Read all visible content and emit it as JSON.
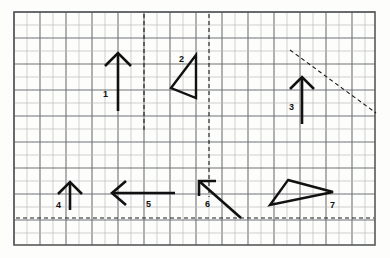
{
  "figure": {
    "name": "vector-diagram-on-graph-paper",
    "caption": "",
    "background_color": "#fdfdfb",
    "grid": {
      "name": "graph-paper-grid",
      "x0": 14,
      "y0": 12,
      "x1": 375,
      "y1": 245,
      "cell_size": 13,
      "minor_color": "#b9bcc0",
      "major_color": "#6e7277",
      "major_every": 2,
      "border_color": "#55585c"
    },
    "guides": [
      {
        "name": "vertical-dashed-guide-left",
        "type": "dashed-line",
        "orientation": "vertical",
        "x1": 144,
        "y1": 14,
        "x2": 144,
        "y2": 132,
        "color": "#1a1a1a"
      },
      {
        "name": "vertical-dashed-guide-right",
        "type": "dashed-line",
        "orientation": "vertical",
        "x1": 209,
        "y1": 14,
        "x2": 209,
        "y2": 197,
        "color": "#1a1a1a"
      },
      {
        "name": "horizontal-dashed-guide",
        "type": "dashed-line",
        "orientation": "horizontal",
        "x1": 16,
        "y1": 218,
        "x2": 374,
        "y2": 218,
        "color": "#1a1a1a"
      },
      {
        "name": "diagonal-dashed-guide",
        "type": "dashed-line",
        "orientation": "diagonal",
        "x1": 290,
        "y1": 50,
        "x2": 376,
        "y2": 113,
        "color": "#1a1a1a"
      }
    ],
    "shapes": [
      {
        "name": "arrow-1",
        "label": "1",
        "kind": "arrow",
        "label_x": 103,
        "label_y": 97,
        "tail_x": 118,
        "tail_y": 111,
        "head_x": 118,
        "head_y": 53,
        "head_left_x": 105,
        "head_left_y": 66,
        "head_right_x": 131,
        "head_right_y": 66,
        "stroke": "#111111",
        "stroke_width": 2.6
      },
      {
        "name": "triangle-2",
        "label": "2",
        "kind": "triangle",
        "label_x": 179,
        "label_y": 62,
        "points": "196,55 171,88 196,98",
        "stroke": "#111111",
        "stroke_width": 2.4
      },
      {
        "name": "arrow-3",
        "label": "3",
        "kind": "arrow",
        "label_x": 289,
        "label_y": 110,
        "tail_x": 302,
        "tail_y": 124,
        "head_x": 302,
        "head_y": 77,
        "head_left_x": 290,
        "head_left_y": 89,
        "head_right_x": 314,
        "head_right_y": 89,
        "stroke": "#111111",
        "stroke_width": 2.6
      },
      {
        "name": "arrow-4",
        "label": "4",
        "kind": "arrow",
        "label_x": 56,
        "label_y": 208,
        "tail_x": 70,
        "tail_y": 210,
        "head_x": 70,
        "head_y": 182,
        "head_left_x": 58,
        "head_left_y": 194,
        "head_right_x": 82,
        "head_right_y": 194,
        "stroke": "#111111",
        "stroke_width": 2.6
      },
      {
        "name": "arrow-5",
        "label": "5",
        "kind": "arrow",
        "label_x": 146,
        "label_y": 207,
        "tail_x": 175,
        "tail_y": 193,
        "head_x": 112,
        "head_y": 193,
        "head_left_x": 126,
        "head_left_y": 181,
        "head_right_x": 126,
        "head_right_y": 205,
        "stroke": "#111111",
        "stroke_width": 2.6
      },
      {
        "name": "arrow-6",
        "label": "6",
        "kind": "arrow",
        "label_x": 205,
        "label_y": 207,
        "tail_x": 241,
        "tail_y": 218,
        "head_x": 199,
        "head_y": 181,
        "head_left_x": 199,
        "head_left_y": 196,
        "head_right_x": 216,
        "head_right_y": 181,
        "stroke": "#111111",
        "stroke_width": 2.6
      },
      {
        "name": "triangle-7",
        "label": "7",
        "kind": "triangle",
        "label_x": 330,
        "label_y": 208,
        "points": "288,180 333,192 270,205",
        "stroke": "#111111",
        "stroke_width": 2.4
      }
    ]
  }
}
